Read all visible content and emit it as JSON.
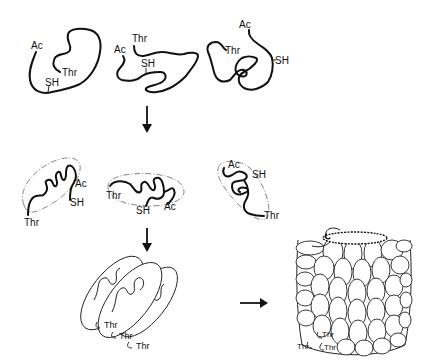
{
  "diagram": {
    "stages": [
      {
        "name": "unfolded-chains",
        "chains": [
          {
            "labels": {
              "n_term": "Ac",
              "cys": "SH",
              "c_term": "Thr"
            }
          },
          {
            "labels": {
              "n_term": "Ac",
              "cys": "SH",
              "c_term": "Thr"
            }
          },
          {
            "labels": {
              "n_term": "Ac",
              "cys": "SH",
              "c_term": "Thr"
            }
          }
        ]
      },
      {
        "name": "folded-monomers",
        "chains": [
          {
            "labels": {
              "n_term": "Ac",
              "cys": "SH",
              "c_term": "Thr"
            }
          },
          {
            "labels": {
              "n_term": "Ac",
              "cys": "SH",
              "c_term": "Thr"
            }
          },
          {
            "labels": {
              "n_term": "Ac",
              "cys": "SH",
              "c_term": "Thr"
            }
          }
        ]
      },
      {
        "name": "stacked-oligomer",
        "labels": [
          "Thr",
          "Thr",
          "Thr"
        ]
      },
      {
        "name": "assembled-cylinder",
        "labels": [
          "Thr",
          "Thr",
          "Thr"
        ]
      }
    ],
    "arrows": [
      {
        "from": "unfolded-chains",
        "to": "folded-monomers",
        "direction": "down"
      },
      {
        "from": "folded-monomers",
        "to": "stacked-oligomer",
        "direction": "down"
      },
      {
        "from": "stacked-oligomer",
        "to": "assembled-cylinder",
        "direction": "right"
      }
    ],
    "colors": {
      "line": "#111111",
      "background": "#ffffff",
      "envelope": "#777777"
    }
  }
}
